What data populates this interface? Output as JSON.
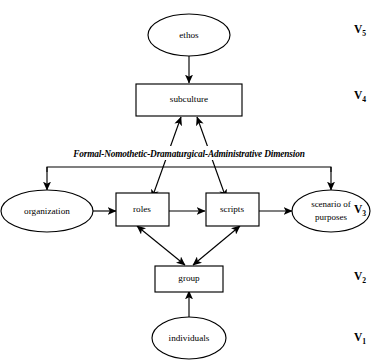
{
  "diagram": {
    "type": "hierarchical-flow-diagram",
    "title_visible": false,
    "dimension_label": "Formal-Nomothetic-Dramaturgical-Administrative Dimension",
    "stroke_color": "#000000",
    "fill_color": "#ffffff",
    "background_color": "#ffffff",
    "nodes": [
      {
        "id": "ethos",
        "label": "ethos",
        "shape": "ellipse",
        "level": "V5"
      },
      {
        "id": "subculture",
        "label": "subculture",
        "shape": "rectangle",
        "level": "V4"
      },
      {
        "id": "organization",
        "label": "organization",
        "shape": "ellipse",
        "level": "V3"
      },
      {
        "id": "roles",
        "label": "roles",
        "shape": "rectangle",
        "level": "V3"
      },
      {
        "id": "scripts",
        "label": "scripts",
        "shape": "rectangle",
        "level": "V3"
      },
      {
        "id": "scenario",
        "label": "scenario of",
        "label2": "purposes",
        "shape": "ellipse",
        "level": "V3"
      },
      {
        "id": "group",
        "label": "group",
        "shape": "rectangle",
        "level": "V2"
      },
      {
        "id": "individuals",
        "label": "individuals",
        "shape": "ellipse",
        "level": "V1"
      }
    ],
    "levels": [
      {
        "id": "V5",
        "letter": "V",
        "subscript": "5"
      },
      {
        "id": "V4",
        "letter": "V",
        "subscript": "4"
      },
      {
        "id": "V3",
        "letter": "V",
        "subscript": "3"
      },
      {
        "id": "V2",
        "letter": "V",
        "subscript": "2"
      },
      {
        "id": "V1",
        "letter": "V",
        "subscript": "1"
      }
    ],
    "edges": [
      {
        "from": "ethos",
        "to": "subculture",
        "arrow": "single"
      },
      {
        "from": "roles",
        "to": "subculture",
        "arrow": "double"
      },
      {
        "from": "scripts",
        "to": "subculture",
        "arrow": "double"
      },
      {
        "from": "organization",
        "to": "roles",
        "arrow": "single"
      },
      {
        "from": "roles",
        "to": "scripts",
        "arrow": "single"
      },
      {
        "from": "scripts",
        "to": "scenario",
        "arrow": "single"
      },
      {
        "from": "roles",
        "to": "group",
        "arrow": "double"
      },
      {
        "from": "scripts",
        "to": "group",
        "arrow": "double"
      },
      {
        "from": "individuals",
        "to": "group",
        "arrow": "single"
      },
      {
        "from": "dimension-bracket",
        "to": "organization",
        "arrow": "single"
      },
      {
        "from": "dimension-bracket",
        "to": "scenario",
        "arrow": "single"
      }
    ]
  }
}
